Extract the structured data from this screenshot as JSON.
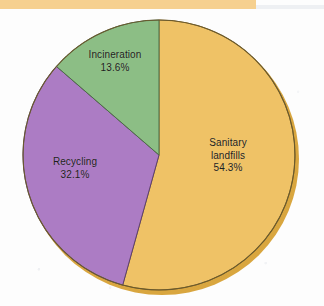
{
  "page": {
    "background_color": "#fdfdfd",
    "top_band_color": "#f6d08f",
    "top_band_rule_color": "#eef0f3"
  },
  "chart_data": {
    "type": "pie",
    "title": "",
    "subtitle": "",
    "xlabel": "",
    "ylabel": "",
    "legend_position": "on-slice",
    "grid": false,
    "units": "percent",
    "start_angle_deg": 0,
    "direction": "clockwise",
    "categories": [
      "Sanitary landfills",
      "Recycling",
      "Incineration"
    ],
    "values": [
      54.3,
      32.1,
      13.6
    ],
    "slices": [
      {
        "label": "Sanitary landfills",
        "label_line_1": "Sanitary",
        "label_line_2": "landfills",
        "value": 54.3,
        "value_text": "54.3%",
        "color": "#efc266",
        "edge_color": "#8a6a28",
        "start_deg": 0,
        "end_deg": 195.48
      },
      {
        "label": "Recycling",
        "label_line_1": "Recycling",
        "label_line_2": "",
        "value": 32.1,
        "value_text": "32.1%",
        "color": "#ac7cc4",
        "edge_color": "#5d4070",
        "start_deg": 195.48,
        "end_deg": 311.04
      },
      {
        "label": "Incineration",
        "label_line_1": "Incineration",
        "label_line_2": "",
        "value": 13.6,
        "value_text": "13.6%",
        "color": "#8cbe85",
        "edge_color": "#4c6c48",
        "start_deg": 311.04,
        "end_deg": 360
      }
    ]
  },
  "labels": {
    "incineration": {
      "name": "Incineration",
      "percent": "13.6%"
    },
    "recycling": {
      "name": "Recycling",
      "percent": "32.1%"
    },
    "landfills": {
      "name_line1": "Sanitary",
      "name_line2": "landfills",
      "percent": "54.3%"
    }
  }
}
